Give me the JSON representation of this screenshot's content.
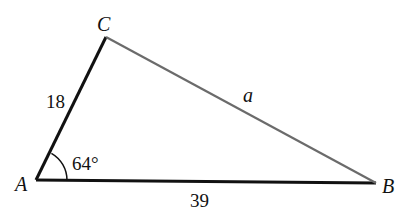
{
  "diagram": {
    "type": "triangle",
    "vertices": {
      "A": {
        "label": "A",
        "x": 36,
        "y": 180
      },
      "B": {
        "label": "B",
        "x": 376,
        "y": 183
      },
      "C": {
        "label": "C",
        "x": 106,
        "y": 37
      }
    },
    "sides": {
      "AC": {
        "label": "18",
        "color": "#111111"
      },
      "AB": {
        "label": "39",
        "color": "#111111"
      },
      "CB": {
        "label": "a",
        "color": "#6b6b6b"
      }
    },
    "angle_A": {
      "label": "64°"
    }
  }
}
